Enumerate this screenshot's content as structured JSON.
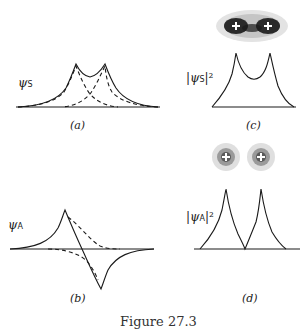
{
  "panels": {
    "a": {
      "label": "ψ",
      "subscript": "S",
      "caption": "(a)"
    },
    "b": {
      "label": "ψ",
      "subscript": "A",
      "caption": "(b)"
    },
    "c": {
      "label": "|ψ",
      "subscript": "S",
      "suffix": "|²",
      "caption": "(c)"
    },
    "d": {
      "label": "|ψ",
      "subscript": "A",
      "suffix": "|²",
      "caption": "(d)"
    }
  },
  "figure_caption": "Figure 27.3",
  "colors": {
    "line": "#1a1a1a",
    "background": "#ffffff"
  }
}
